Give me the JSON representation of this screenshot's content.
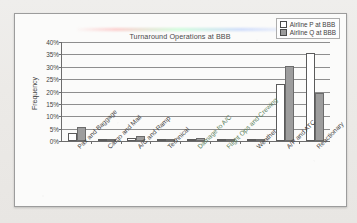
{
  "chart_data": {
    "type": "bar",
    "title": "Turnaround Operations at BBB",
    "xlabel": "",
    "ylabel": "Frequency",
    "ylim": [
      0,
      40
    ],
    "ytick_step": 5,
    "ytick_labels": [
      "40%",
      "35%",
      "30%",
      "25%",
      "20%",
      "15%",
      "10%",
      "5%",
      "0%"
    ],
    "grid": true,
    "legend_position": "top-right",
    "categories": [
      "Pax and Baggage",
      "Cargo and Mail",
      "A/C and Ramp",
      "Technical",
      "Damage to A/C",
      "Flight Ops and Crewing",
      "Weather",
      "A/P and ATC",
      "Reactionary"
    ],
    "series": [
      {
        "name": "Airline P at BBB",
        "color": "#ffffff",
        "values": [
          3.2,
          0.2,
          1.2,
          0.3,
          0.2,
          0.2,
          0.2,
          23.0,
          35.5
        ]
      },
      {
        "name": "Airline Q at BBB",
        "color": "#9d9d9d",
        "values": [
          5.5,
          0.3,
          2.1,
          0.4,
          1.3,
          0.3,
          1.0,
          30.4,
          19.5
        ]
      }
    ]
  },
  "legend": {
    "items": [
      {
        "label": "Airline P at BBB",
        "swatch": "p"
      },
      {
        "label": "Airline Q at BBB",
        "swatch": "q"
      }
    ]
  }
}
